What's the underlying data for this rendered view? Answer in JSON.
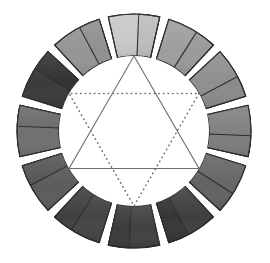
{
  "figure": {
    "type": "color-wheel-diagram",
    "rendering": "grayscale",
    "background_color": "#ffffff",
    "segment_count": 12,
    "segment_outline_color": "#2b2b2b",
    "gap_color": "#ffffff"
  },
  "geometry": {
    "center_x": 134,
    "center_y": 131,
    "outer_radius": 117,
    "inner_radius": 75,
    "segment_arc_degrees": 30,
    "segment_gap_degrees": 4.6,
    "triangle_vertex_radius": 75
  },
  "chart_data": {
    "type": "pie",
    "legend": "none",
    "grid": false,
    "categories": [
      "segment-01-top",
      "segment-02",
      "segment-03",
      "segment-04",
      "segment-05",
      "segment-06-bottom",
      "segment-07",
      "segment-08",
      "segment-09",
      "segment-10",
      "segment-11",
      "segment-12"
    ],
    "values": [
      30,
      30,
      30,
      30,
      30,
      30,
      30,
      30,
      30,
      30,
      30,
      30
    ],
    "series": [
      {
        "name": "tonal value (0=black, 100=white)",
        "values": [
          82,
          62,
          56,
          50,
          40,
          30,
          25,
          27,
          36,
          44,
          22,
          58
        ]
      }
    ],
    "colors": [
      "#c9c9c9",
      "#9e9e9e",
      "#8f8f8f",
      "#818181",
      "#676767",
      "#4e4e4e",
      "#414141",
      "#454545",
      "#5c5c5c",
      "#707070",
      "#3a3a3a",
      "#959595"
    ],
    "annotations": [
      "solid triangle: apex at 12 o'clock, base spanning 4 and 8 o'clock",
      "dotted triangle: apex at 6 o'clock, base spanning 10 and 2 o'clock"
    ]
  },
  "segments": [
    {
      "index": 1,
      "name": "segment-top",
      "start_angle": -15,
      "end_angle": 15,
      "fill": "#c9c9c9",
      "split_fill": "#bdbdbd",
      "value": 82
    },
    {
      "index": 2,
      "name": "segment-upper-right",
      "start_angle": 15,
      "end_angle": 45,
      "fill": "#9e9e9e",
      "split_fill": "#9a9a9a",
      "value": 62
    },
    {
      "index": 3,
      "name": "segment-right-upper",
      "start_angle": 45,
      "end_angle": 75,
      "fill": "#8f8f8f",
      "split_fill": "#8b8b8b",
      "value": 56
    },
    {
      "index": 4,
      "name": "segment-right",
      "start_angle": 75,
      "end_angle": 105,
      "fill": "#818181",
      "split_fill": "#7d7d7d",
      "value": 50
    },
    {
      "index": 5,
      "name": "segment-right-lower",
      "start_angle": 105,
      "end_angle": 135,
      "fill": "#676767",
      "split_fill": "#626262",
      "value": 40
    },
    {
      "index": 6,
      "name": "segment-lower-right",
      "start_angle": 135,
      "end_angle": 165,
      "fill": "#3f3f3f",
      "split_fill": "#373737",
      "value": 26
    },
    {
      "index": 7,
      "name": "segment-bottom",
      "start_angle": 165,
      "end_angle": 195,
      "fill": "#414141",
      "split_fill": "#3b3b3b",
      "value": 25
    },
    {
      "index": 8,
      "name": "segment-lower-left",
      "start_angle": 195,
      "end_angle": 225,
      "fill": "#454545",
      "split_fill": "#404040",
      "value": 27
    },
    {
      "index": 9,
      "name": "segment-left-lower",
      "start_angle": 225,
      "end_angle": 255,
      "fill": "#5c5c5c",
      "split_fill": "#565656",
      "value": 36
    },
    {
      "index": 10,
      "name": "segment-left",
      "start_angle": 255,
      "end_angle": 285,
      "fill": "#707070",
      "split_fill": "#6b6b6b",
      "value": 44
    },
    {
      "index": 11,
      "name": "segment-left-upper",
      "start_angle": 285,
      "end_angle": 315,
      "fill": "#3a3a3a",
      "split_fill": "#333333",
      "value": 22
    },
    {
      "index": 12,
      "name": "segment-upper-left",
      "start_angle": 315,
      "end_angle": 345,
      "fill": "#959595",
      "split_fill": "#909090",
      "value": 58
    }
  ],
  "triangles": [
    {
      "name": "primary-triangle-solid",
      "style": "solid",
      "stroke": "#6d6d6d",
      "vertex_angles": [
        0,
        120,
        240
      ],
      "description": "Solid equilateral triangle, apex pointing up"
    },
    {
      "name": "secondary-triangle-dotted",
      "style": "dotted",
      "stroke": "#6b6b6b",
      "vertex_angles": [
        60,
        180,
        300
      ],
      "description": "Dotted equilateral triangle, apex pointing down"
    }
  ]
}
